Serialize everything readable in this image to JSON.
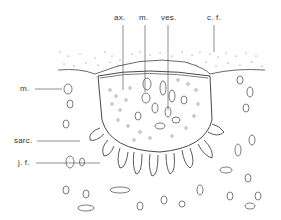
{
  "figure": {
    "labels_top": [
      {
        "id": "ax",
        "text": "ax.",
        "x": 114,
        "y": 14,
        "line_x": 123,
        "line_y1": 25,
        "line_y2": 90
      },
      {
        "id": "m_top",
        "text": "m.",
        "x": 139,
        "y": 14,
        "line_x": 145,
        "line_y1": 25,
        "line_y2": 92
      },
      {
        "id": "ves",
        "text": "ves.",
        "x": 161,
        "y": 14,
        "line_x": 168,
        "line_y1": 25,
        "line_y2": 110
      },
      {
        "id": "cf",
        "text": "c. f.",
        "x": 207,
        "y": 14,
        "line_x": 214,
        "line_y1": 25,
        "line_y2": 52
      }
    ],
    "labels_left": [
      {
        "id": "m_left",
        "text": "m.",
        "x": 20,
        "y": 85,
        "line_x1": 35,
        "line_x2": 62,
        "line_y": 89
      },
      {
        "id": "sarc",
        "text": "sarc.",
        "x": 14,
        "y": 137,
        "line_x1": 37,
        "line_x2": 80,
        "line_y": 141
      },
      {
        "id": "jf",
        "text": "j. f.",
        "x": 18,
        "y": 159,
        "line_x1": 36,
        "line_x2": 100,
        "line_y": 163
      }
    ],
    "colors": {
      "ink": "#3a3a3a",
      "background": "#ffffff",
      "dots": "#555555"
    }
  }
}
